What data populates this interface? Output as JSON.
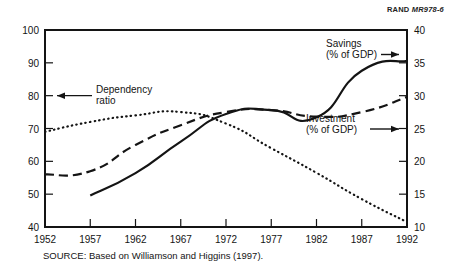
{
  "header": {
    "org": "RAND",
    "figure_code": "MR978-6"
  },
  "source": {
    "text": "SOURCE: Based on Williamson and Higgins (1997)."
  },
  "annotations": {
    "dependency": {
      "line1": "Dependency",
      "line2": "ratio",
      "arrow": "left-arrow-icon"
    },
    "savings": {
      "line1": "Savings",
      "line2": "(% of GDP)",
      "arrow": "right-arrow-icon"
    },
    "investment": {
      "line1": "Investment",
      "line2": "(% of GDP)",
      "arrow": "right-arrow-icon"
    }
  },
  "chart_data": {
    "type": "line",
    "title": "",
    "xlabel": "",
    "ylabel": "",
    "grid": false,
    "legend_position": "inline-annotations",
    "x": [
      1952,
      1957,
      1962,
      1967,
      1972,
      1977,
      1982,
      1987,
      1992
    ],
    "xticks": [
      "1952",
      "1957",
      "1962",
      "1967",
      "1972",
      "1977",
      "1982",
      "1987",
      "1992"
    ],
    "xlim": [
      1952,
      1992
    ],
    "left_axis": {
      "label": "",
      "ylim": [
        40,
        100
      ],
      "ticks": [
        40,
        50,
        60,
        70,
        80,
        90,
        100
      ],
      "ticklabels": [
        "40",
        "50",
        "60",
        "70",
        "80",
        "90",
        "100"
      ]
    },
    "right_axis": {
      "label": "",
      "ylim": [
        10,
        40
      ],
      "ticks": [
        10,
        15,
        20,
        25,
        30,
        35,
        40
      ],
      "ticklabels": [
        "10",
        "15",
        "20",
        "25",
        "30",
        "35",
        "40"
      ]
    },
    "series": [
      {
        "name": "Dependency ratio",
        "axis": "left",
        "style": "dotted",
        "x": [
          1952,
          1957,
          1962,
          1967,
          1972,
          1977,
          1982,
          1987,
          1992
        ],
        "values": [
          69.0,
          72.0,
          74.0,
          75.0,
          71.5,
          64.0,
          56.5,
          48.5,
          41.5
        ]
      },
      {
        "name": "Investment (% of GDP)",
        "axis": "right",
        "style": "dashed",
        "x": [
          1952,
          1957,
          1962,
          1967,
          1972,
          1977,
          1982,
          1987,
          1992
        ],
        "values": [
          18.0,
          18.5,
          22.5,
          25.5,
          27.5,
          27.8,
          26.8,
          27.5,
          29.8
        ]
      },
      {
        "name": "Savings (% of GDP)",
        "axis": "right",
        "style": "solid",
        "x": [
          1957,
          1962,
          1967,
          1972,
          1977,
          1982,
          1987,
          1992
        ],
        "values": [
          14.8,
          18.2,
          23.0,
          27.2,
          27.8,
          26.7,
          33.8,
          35.3
        ]
      }
    ]
  }
}
